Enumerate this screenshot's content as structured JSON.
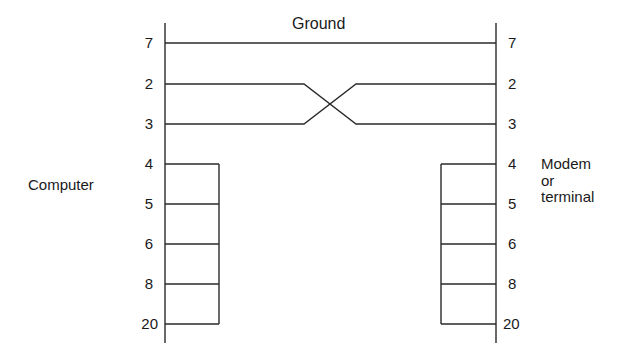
{
  "title": "Ground",
  "left_device": "Computer",
  "right_device": {
    "line1": "Modem",
    "line2": "or",
    "line3": "terminal"
  },
  "pins": [
    "7",
    "2",
    "3",
    "4",
    "5",
    "6",
    "8",
    "20"
  ],
  "connections": [
    {
      "from": "7",
      "to": "7",
      "label": "Ground"
    },
    {
      "from": "2",
      "to": "3",
      "type": "crossover"
    },
    {
      "from": "3",
      "to": "2",
      "type": "crossover"
    },
    {
      "loopback_left": [
        "4",
        "5",
        "6",
        "8",
        "20"
      ]
    },
    {
      "loopback_right": [
        "4",
        "5",
        "6",
        "8",
        "20"
      ]
    }
  ]
}
